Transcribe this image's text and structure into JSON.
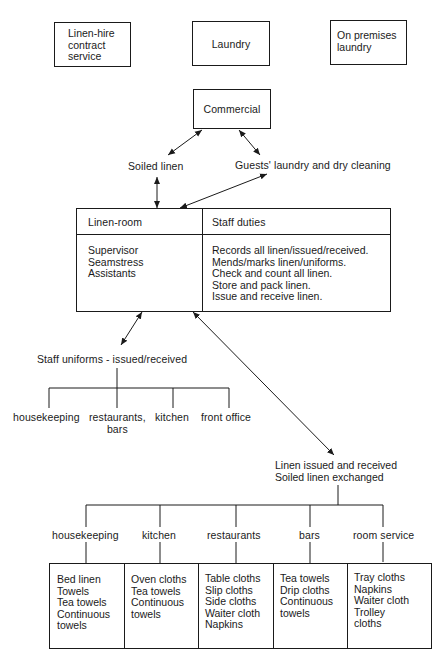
{
  "top_boxes": [
    {
      "label_lines": [
        "Linen-hire",
        "contract",
        "service"
      ]
    },
    {
      "label_lines": [
        "Laundry"
      ]
    },
    {
      "label_lines": [
        "On premises",
        "laundry"
      ]
    }
  ],
  "commercial_box": {
    "label": "Commercial"
  },
  "flows": {
    "soiled_linen": "Soiled linen",
    "guests_laundry": "Guests' laundry and dry cleaning"
  },
  "linen_room": {
    "header_left": "Linen-room",
    "header_right": "Staff duties",
    "staff": [
      "Supervisor",
      "Seamstress",
      "Assistants"
    ],
    "duties": [
      "Records all linen/issued/received.",
      "Mends/marks linen/uniforms.",
      "Check and count all linen.",
      "Store and pack linen.",
      "Issue and receive linen."
    ]
  },
  "uniforms": {
    "title": "Staff uniforms - issued/received",
    "departments": [
      "housekeeping",
      "restaurants,\nbars",
      "kitchen",
      "front office"
    ]
  },
  "linen_exchange": {
    "title_lines": [
      "Linen issued and received",
      "Soiled linen exchanged"
    ],
    "departments": [
      {
        "name": "housekeeping",
        "items": [
          "Bed linen",
          "Towels",
          "Tea towels",
          "Continuous",
          "towels"
        ]
      },
      {
        "name": "kitchen",
        "items": [
          "Oven cloths",
          "Tea towels",
          "Continuous",
          "towels"
        ]
      },
      {
        "name": "restaurants",
        "items": [
          "Table cloths",
          "Slip cloths",
          "Side cloths",
          "Waiter cloth",
          "Napkins"
        ]
      },
      {
        "name": "bars",
        "items": [
          "Tea towels",
          "Drip cloths",
          "Continuous",
          "towels"
        ]
      },
      {
        "name": "room service",
        "items": [
          "Tray cloths",
          "Napkins",
          "Waiter cloth",
          "Trolley",
          "cloths"
        ]
      }
    ]
  }
}
